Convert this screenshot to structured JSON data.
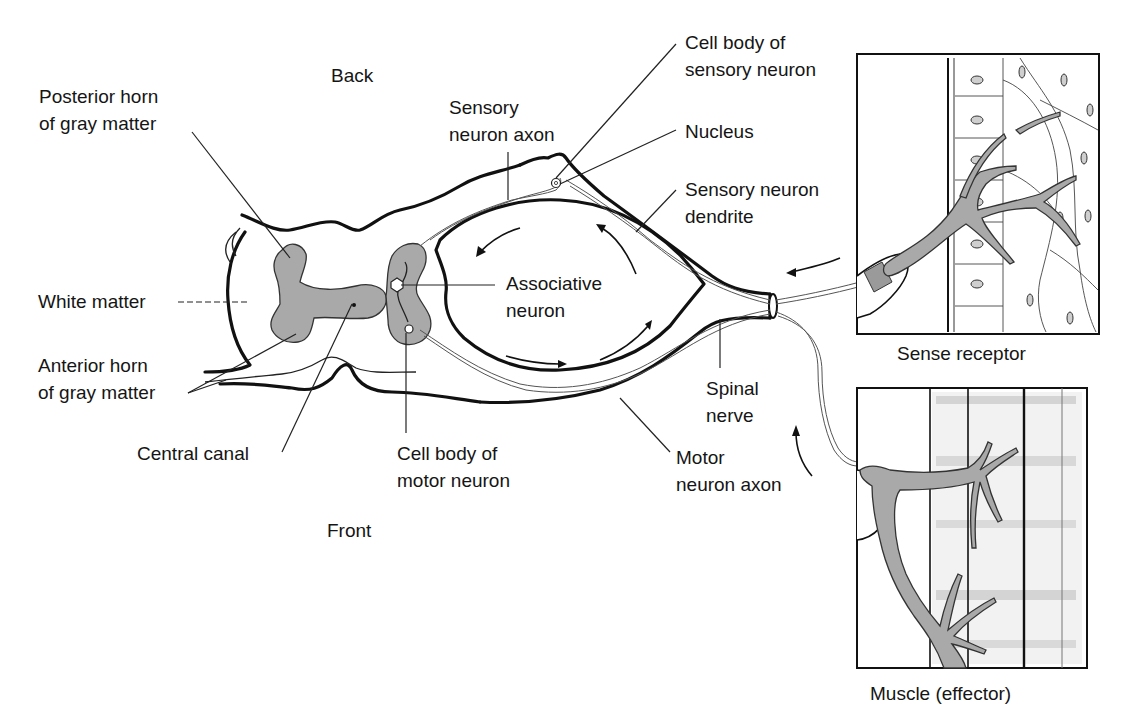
{
  "diagram": {
    "type": "reflex-arc",
    "orientation_labels": {
      "top": "Back",
      "bottom": "Front"
    },
    "labels": {
      "posterior_horn": [
        "Posterior horn",
        "of gray matter"
      ],
      "white_matter": [
        "White matter"
      ],
      "anterior_horn": [
        "Anterior horn",
        "of gray matter"
      ],
      "central_canal": [
        "Central canal"
      ],
      "cell_body_motor": [
        "Cell body of",
        "motor neuron"
      ],
      "sensory_axon": [
        "Sensory",
        "neuron axon"
      ],
      "cell_body_sensory": [
        "Cell body of",
        "sensory neuron"
      ],
      "nucleus": [
        "Nucleus"
      ],
      "sensory_dendrite": [
        "Sensory neuron",
        "dendrite"
      ],
      "associative_neuron": [
        "Associative",
        "neuron"
      ],
      "spinal_nerve": [
        "Spinal",
        "nerve"
      ],
      "motor_axon": [
        "Motor",
        "neuron axon"
      ]
    },
    "insets": [
      {
        "id": "sense-receptor",
        "caption": "Sense receptor"
      },
      {
        "id": "muscle",
        "caption": "Muscle (effector)"
      }
    ],
    "signal_flow": [
      "Sense receptor",
      "Sensory neuron dendrite",
      "Cell body of sensory neuron",
      "Sensory neuron axon",
      "Associative neuron",
      "Motor neuron axon",
      "Muscle (effector)"
    ],
    "colors": {
      "ink": "#111111",
      "gray_matter": "#a9a9a9",
      "background": "#ffffff"
    }
  }
}
